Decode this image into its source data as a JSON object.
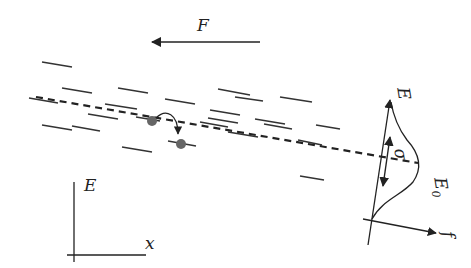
{
  "diagram": {
    "type": "hopping transport in disordered energy landscape",
    "labels": {
      "force": "F",
      "energy_axis_left": "E",
      "position_axis": "x",
      "energy_axis_dos": "E",
      "dos_axis": "f",
      "center_energy": "E",
      "center_energy_subscript": "0",
      "width": "σ"
    },
    "colors": {
      "stroke": "#222222",
      "site_dot": "#666666",
      "background": "#ffffff"
    },
    "energy_sites": [
      [
        42,
        62,
        72,
        67
      ],
      [
        62,
        88,
        92,
        93
      ],
      [
        118,
        88,
        148,
        93
      ],
      [
        218,
        89,
        250,
        95
      ],
      [
        29,
        98,
        58,
        103
      ],
      [
        105,
        104,
        137,
        109
      ],
      [
        165,
        99,
        195,
        104
      ],
      [
        235,
        97,
        263,
        101
      ],
      [
        88,
        114,
        118,
        119
      ],
      [
        136,
        117,
        160,
        121
      ],
      [
        210,
        110,
        240,
        115
      ],
      [
        255,
        119,
        285,
        124
      ],
      [
        42,
        125,
        72,
        130
      ],
      [
        72,
        126,
        100,
        131
      ],
      [
        200,
        122,
        228,
        127
      ],
      [
        264,
        124,
        292,
        129
      ],
      [
        280,
        97,
        312,
        102
      ],
      [
        298,
        140,
        322,
        145
      ],
      [
        122,
        147,
        152,
        152
      ],
      [
        168,
        141,
        196,
        146
      ],
      [
        228,
        132,
        258,
        137
      ],
      [
        208,
        118,
        238,
        123
      ],
      [
        316,
        125,
        340,
        129
      ],
      [
        300,
        176,
        324,
        180
      ]
    ],
    "hop": {
      "from": [
        152,
        121
      ],
      "to": [
        181,
        144
      ]
    }
  }
}
